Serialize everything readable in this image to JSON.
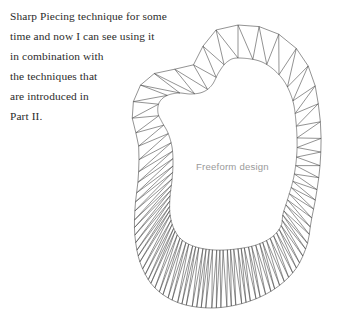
{
  "page": {
    "width": 344,
    "height": 321,
    "background_color": "#ffffff"
  },
  "body_text": {
    "color": "#2b2b2b",
    "lines": [
      "Sharp Piecing technique for some",
      "time and now I can see using it",
      "in combination with",
      "the techniques that",
      "are introduced in",
      "Part II."
    ]
  },
  "figure": {
    "label": "Freeform design",
    "label_color": "#9a9a9a",
    "stroke_color": "#4a4a4a",
    "stroke_width": 0.6,
    "fill_color": "#ffffff",
    "bounds": {
      "x_min": 132,
      "x_max": 332,
      "y_min": 25,
      "y_max": 310
    },
    "inner_curve_points": [
      [
        238,
        58
      ],
      [
        262,
        62
      ],
      [
        281,
        77
      ],
      [
        292,
        98
      ],
      [
        296,
        122
      ],
      [
        297,
        150
      ],
      [
        294,
        176
      ],
      [
        288,
        198
      ],
      [
        283,
        214
      ],
      [
        281,
        226
      ],
      [
        272,
        237
      ],
      [
        256,
        245
      ],
      [
        236,
        249
      ],
      [
        215,
        250
      ],
      [
        196,
        247
      ],
      [
        182,
        240
      ],
      [
        174,
        229
      ],
      [
        170,
        214
      ],
      [
        170,
        197
      ],
      [
        172,
        180
      ],
      [
        173,
        163
      ],
      [
        172,
        147
      ],
      [
        168,
        133
      ],
      [
        162,
        122
      ],
      [
        158,
        113
      ],
      [
        159,
        103
      ],
      [
        166,
        96
      ],
      [
        178,
        93
      ],
      [
        191,
        94
      ],
      [
        203,
        92
      ],
      [
        212,
        85
      ],
      [
        219,
        72
      ],
      [
        227,
        62
      ]
    ],
    "outer_curve_points": [
      [
        238,
        25
      ],
      [
        268,
        29
      ],
      [
        294,
        46
      ],
      [
        311,
        72
      ],
      [
        318,
        102
      ],
      [
        321,
        133
      ],
      [
        320,
        166
      ],
      [
        316,
        196
      ],
      [
        311,
        222
      ],
      [
        307,
        245
      ],
      [
        295,
        270
      ],
      [
        273,
        290
      ],
      [
        244,
        303
      ],
      [
        211,
        308
      ],
      [
        179,
        303
      ],
      [
        155,
        288
      ],
      [
        141,
        265
      ],
      [
        135,
        237
      ],
      [
        135,
        208
      ],
      [
        138,
        181
      ],
      [
        139,
        158
      ],
      [
        138,
        140
      ],
      [
        134,
        127
      ],
      [
        132,
        112
      ],
      [
        136,
        93
      ],
      [
        147,
        78
      ],
      [
        164,
        70
      ],
      [
        181,
        69
      ],
      [
        192,
        66
      ],
      [
        199,
        57
      ],
      [
        205,
        42
      ],
      [
        216,
        30
      ]
    ],
    "band_segments": 32,
    "zigzag_density": "variable — sparse at top, dense along bottom fan"
  }
}
